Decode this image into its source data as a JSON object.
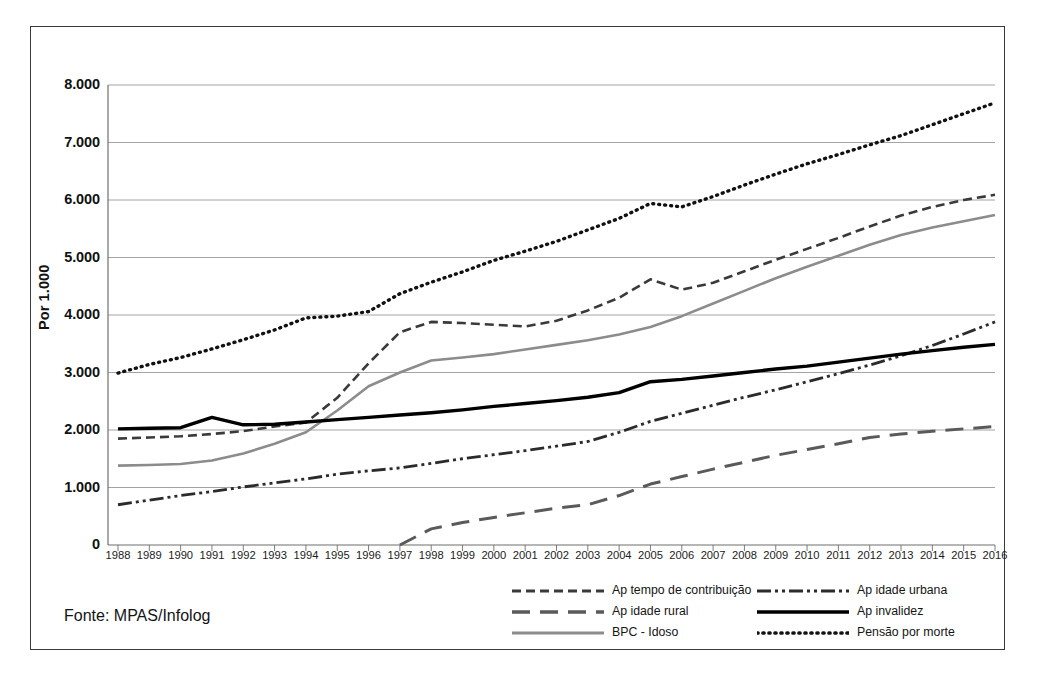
{
  "figure": {
    "source_note": "Fonte: MPAS/Infolog",
    "y_axis_title": "Por 1.000"
  },
  "chart_data": {
    "type": "line",
    "title": "",
    "subtitle": "",
    "xlabel": "",
    "ylabel": "Por 1.000",
    "ylim": [
      0,
      8000
    ],
    "xlim": [
      "1988",
      "2016"
    ],
    "grid": true,
    "legend_position": "bottom-right",
    "y_ticks": [
      "0",
      "1.000",
      "2.000",
      "3.000",
      "4.000",
      "5.000",
      "6.000",
      "7.000",
      "8.000"
    ],
    "y_tick_values": [
      0,
      1000,
      2000,
      3000,
      4000,
      5000,
      6000,
      7000,
      8000
    ],
    "categories": [
      "1988",
      "1989",
      "1990",
      "1991",
      "1992",
      "1993",
      "1994",
      "1995",
      "1996",
      "1997",
      "1998",
      "1999",
      "2000",
      "2001",
      "2002",
      "2003",
      "2004",
      "2005",
      "2006",
      "2007",
      "2008",
      "2009",
      "2010",
      "2011",
      "2012",
      "2013",
      "2014",
      "2015",
      "2016"
    ],
    "series": [
      {
        "name": "Ap tempo de contribuição",
        "style": "dashed",
        "color": "#3a3a3a",
        "width": 2.6,
        "dash": "9,5",
        "values": [
          1850,
          1870,
          1890,
          1930,
          1980,
          2060,
          2130,
          2560,
          3160,
          3700,
          3880,
          3860,
          3830,
          3800,
          3900,
          4080,
          4300,
          4620,
          4440,
          4560,
          4760,
          4960,
          5150,
          5340,
          5540,
          5730,
          5880,
          6000,
          6090
        ]
      },
      {
        "name": "Ap idade rural",
        "style": "long-dashed",
        "color": "#5a5a5a",
        "width": 3.0,
        "dash": "18,10",
        "values": [
          null,
          null,
          null,
          null,
          null,
          null,
          null,
          null,
          null,
          0,
          280,
          390,
          480,
          560,
          640,
          700,
          860,
          1060,
          1190,
          1320,
          1440,
          1560,
          1660,
          1760,
          1870,
          1930,
          1980,
          2020,
          2060
        ]
      },
      {
        "name": "BPC - Idoso",
        "style": "solid",
        "color": "#8c8c8c",
        "width": 2.6,
        "dash": "",
        "values": [
          1380,
          1390,
          1410,
          1470,
          1590,
          1760,
          1960,
          2340,
          2760,
          3000,
          3210,
          3260,
          3320,
          3400,
          3480,
          3560,
          3660,
          3790,
          3980,
          4200,
          4420,
          4640,
          4840,
          5030,
          5220,
          5390,
          5520,
          5630,
          5740
        ]
      },
      {
        "name": "Ap idade urbana",
        "style": "dash-dot-dot",
        "color": "#2b2b2b",
        "width": 2.8,
        "dash": "14,4,3,4,3,4",
        "values": [
          700,
          780,
          860,
          930,
          1010,
          1080,
          1150,
          1230,
          1290,
          1340,
          1420,
          1500,
          1570,
          1640,
          1720,
          1800,
          1960,
          2150,
          2290,
          2430,
          2570,
          2700,
          2840,
          2980,
          3130,
          3290,
          3470,
          3670,
          3880
        ]
      },
      {
        "name": "Ap invalidez",
        "style": "solid",
        "color": "#000000",
        "width": 3.4,
        "dash": "",
        "values": [
          2020,
          2030,
          2040,
          2220,
          2090,
          2100,
          2140,
          2180,
          2220,
          2260,
          2300,
          2350,
          2410,
          2460,
          2510,
          2570,
          2650,
          2840,
          2880,
          2940,
          3000,
          3060,
          3110,
          3180,
          3250,
          3320,
          3380,
          3440,
          3490
        ]
      },
      {
        "name": "Pensão por morte",
        "style": "dotted",
        "color": "#111111",
        "width": 3.4,
        "dash": "1,5",
        "values": [
          2990,
          3140,
          3260,
          3410,
          3570,
          3740,
          3950,
          3980,
          4060,
          4370,
          4570,
          4750,
          4950,
          5110,
          5280,
          5480,
          5680,
          5940,
          5880,
          6060,
          6260,
          6450,
          6630,
          6790,
          6960,
          7120,
          7310,
          7500,
          7690
        ]
      }
    ]
  },
  "legend": {
    "left_column": [
      {
        "label": "Ap tempo de contribuição",
        "series_index": 0
      },
      {
        "label": "Ap idade rural",
        "series_index": 1
      },
      {
        "label": "BPC - Idoso",
        "series_index": 2
      }
    ],
    "right_column": [
      {
        "label": "Ap idade urbana",
        "series_index": 3
      },
      {
        "label": "Ap invalidez",
        "series_index": 4
      },
      {
        "label": "Pensão por morte",
        "series_index": 5
      }
    ]
  }
}
